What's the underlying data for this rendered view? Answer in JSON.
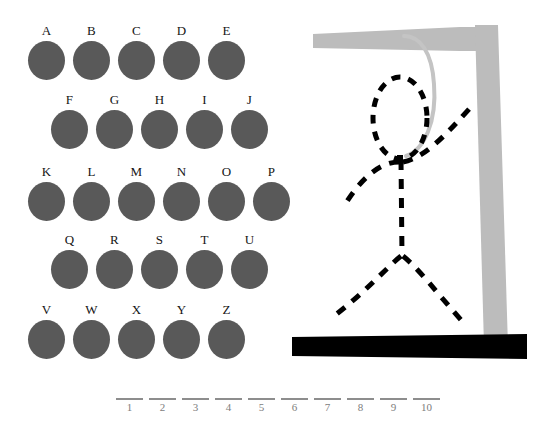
{
  "app": {
    "title": "Hangman",
    "background_color": "#ffffff"
  },
  "colors": {
    "letter_disc": "#595959",
    "letter_text": "#151515",
    "gallows": "#bcbcbc",
    "rope": "#c4c4c4",
    "ground": "#000000",
    "figure": "#000000",
    "blank_line": "#8d8d8d",
    "blank_number": "#7d7d7d"
  },
  "keyboard": {
    "rows": [
      {
        "indent": 24,
        "letters": [
          "A",
          "B",
          "C",
          "D",
          "E"
        ]
      },
      {
        "indent": 47,
        "letters": [
          "F",
          "G",
          "H",
          "I",
          "J"
        ]
      },
      {
        "indent": 24,
        "letters": [
          "K",
          "L",
          "M",
          "N",
          "O",
          "P"
        ]
      },
      {
        "indent": 47,
        "letters": [
          "Q",
          "R",
          "S",
          "T",
          "U"
        ]
      },
      {
        "indent": 24,
        "letters": [
          "V",
          "W",
          "X",
          "Y",
          "Z"
        ]
      }
    ],
    "row_tops": [
      24,
      93,
      165,
      233,
      303
    ]
  },
  "answer": {
    "slots": [
      {
        "number": "1",
        "letter": ""
      },
      {
        "number": "2",
        "letter": ""
      },
      {
        "number": "3",
        "letter": ""
      },
      {
        "number": "4",
        "letter": ""
      },
      {
        "number": "5",
        "letter": ""
      },
      {
        "number": "6",
        "letter": ""
      },
      {
        "number": "7",
        "letter": ""
      },
      {
        "number": "8",
        "letter": ""
      },
      {
        "number": "9",
        "letter": ""
      },
      {
        "number": "10",
        "letter": ""
      }
    ]
  },
  "gallows": {
    "parts_drawn": [
      "head",
      "left-arm",
      "right-arm",
      "torso",
      "left-leg",
      "right-leg"
    ],
    "rope_attached": true
  }
}
